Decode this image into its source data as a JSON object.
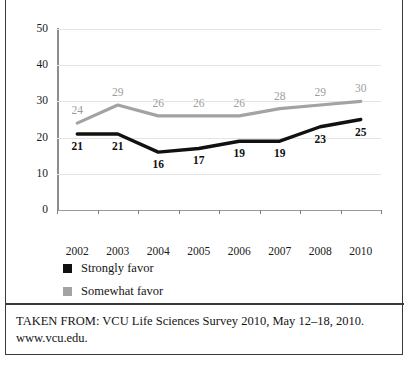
{
  "chart_data": {
    "type": "line",
    "title": "",
    "xlabel": "",
    "ylabel": "",
    "categories": [
      "2002",
      "2003",
      "2004",
      "2005",
      "2006",
      "2007",
      "2008",
      "2010"
    ],
    "ylim": [
      0,
      50
    ],
    "yticks": [
      0,
      10,
      20,
      30,
      40,
      50
    ],
    "grid": true,
    "legend_position": "bottom-left",
    "series": [
      {
        "name": "Strongly favor",
        "color": "#111111",
        "values": [
          21,
          21,
          16,
          17,
          19,
          19,
          23,
          25
        ],
        "label_position": "below"
      },
      {
        "name": "Somewhat favor",
        "color": "#a3a3a3",
        "values": [
          24,
          29,
          26,
          26,
          26,
          28,
          29,
          30
        ],
        "label_position": "above"
      }
    ]
  },
  "legend": {
    "items": [
      {
        "label": "Strongly favor",
        "color": "#111111"
      },
      {
        "label": "Somewhat favor",
        "color": "#a3a3a3"
      }
    ]
  },
  "caption": {
    "source": "TAKEN FROM: VCU Life Sciences Survey 2010, May 12–18, 2010.",
    "url": "www.vcu.edu."
  }
}
